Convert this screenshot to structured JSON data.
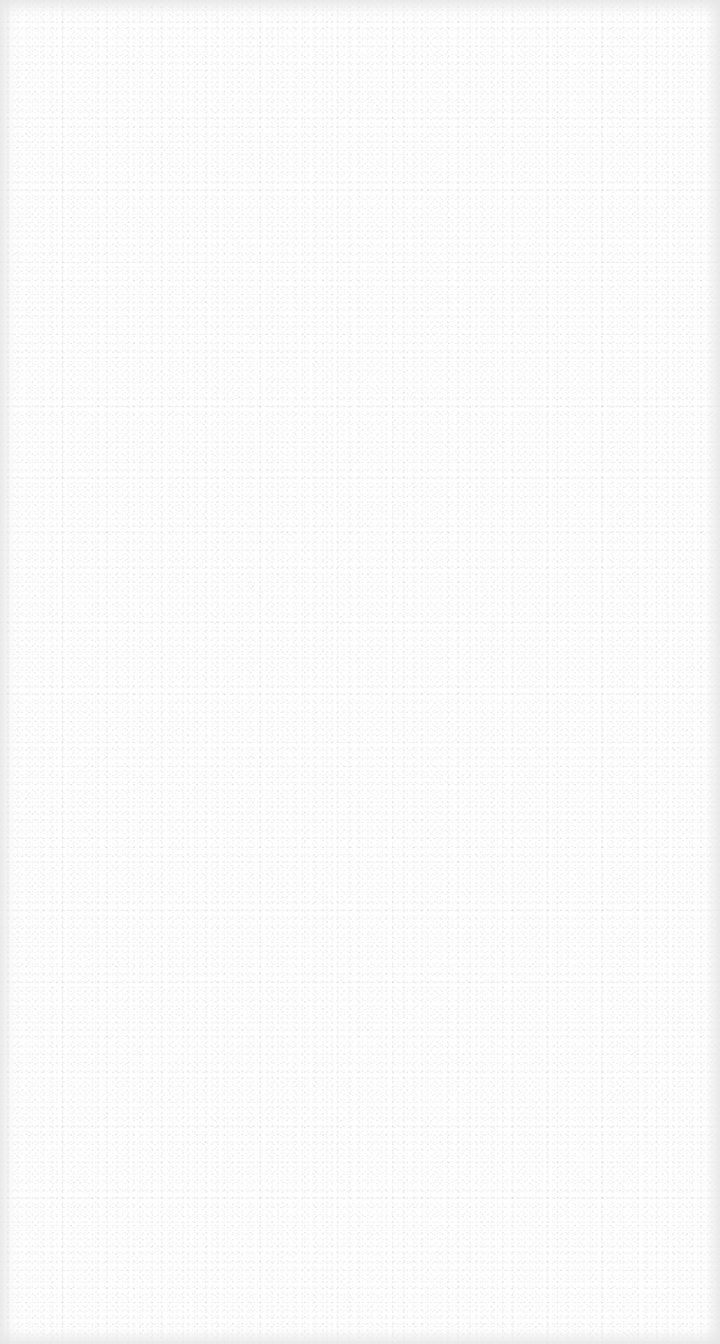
{
  "screen": {
    "background_color": "#ffffff",
    "edge_shade_color": "#e6e6e6"
  }
}
